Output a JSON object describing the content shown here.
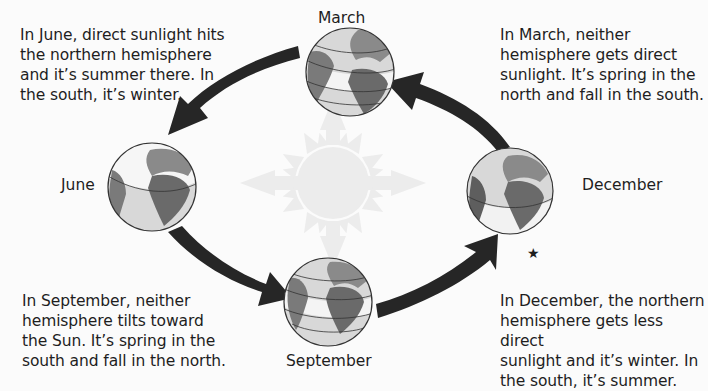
{
  "diagram": {
    "title": "",
    "center": {
      "name": "Sun",
      "color": "#ececec"
    },
    "seasons": [
      {
        "id": "march",
        "label": "March",
        "caption": [
          "In March, neither",
          "hemisphere gets direct",
          "sunlight. It’s spring in the",
          "north and fall in the south."
        ]
      },
      {
        "id": "june",
        "label": "June",
        "caption": [
          "In June, direct sunlight hits",
          "the northern hemisphere",
          "and it’s summer there. In",
          "the south, it’s winter."
        ]
      },
      {
        "id": "september",
        "label": "September",
        "caption": [
          "In September, neither",
          "hemisphere tilts toward",
          "the Sun. It’s spring in the",
          "south and fall in the north."
        ]
      },
      {
        "id": "december",
        "label": "December",
        "caption": [
          "In December, the northern",
          "hemisphere gets less direct",
          "sunlight and it’s winter. In",
          "the south, it’s summer."
        ]
      }
    ],
    "star_marker": "★",
    "arrows": [
      {
        "from": "march",
        "to": "june"
      },
      {
        "from": "june",
        "to": "september"
      },
      {
        "from": "september",
        "to": "december"
      },
      {
        "from": "december",
        "to": "march"
      }
    ],
    "colors": {
      "arrow": "#262626",
      "ocean": "#d6d6d6",
      "land": "#8a8a8a",
      "land_dark": "#5e5e5e",
      "lit_band": "#f6f6f6",
      "sun": "#ececec"
    }
  }
}
